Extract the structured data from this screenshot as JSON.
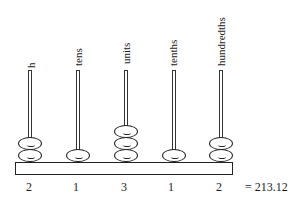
{
  "diagram": {
    "type": "abacus",
    "columns": [
      {
        "label": "h",
        "beads": 2,
        "digit": "2"
      },
      {
        "label": "tens",
        "beads": 1,
        "digit": "1"
      },
      {
        "label": "units",
        "beads": 3,
        "digit": "3"
      },
      {
        "label": "tenths",
        "beads": 1,
        "digit": "1"
      },
      {
        "label": "hundredths",
        "beads": 2,
        "digit": "2"
      }
    ],
    "result": "= 213.12"
  }
}
